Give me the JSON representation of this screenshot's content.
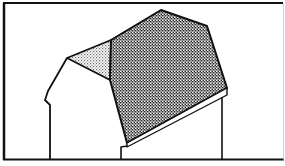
{
  "figure": {
    "colors": {
      "ink": "#111111",
      "background": "#ffffff",
      "roof_fill_dark": "#8a8a8a",
      "gable_fill_light": "#c8c8c8"
    },
    "parts": [
      "frame",
      "left-wall",
      "gable-end",
      "main-roof",
      "eave-strip",
      "right-wall",
      "notch-wall"
    ]
  }
}
